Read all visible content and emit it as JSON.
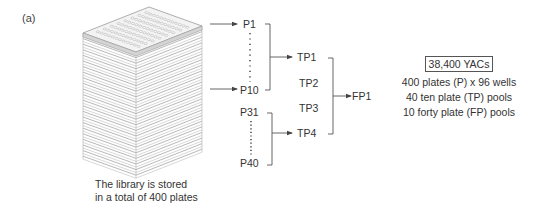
{
  "panel_label": "(a)",
  "stack": {
    "caption_line1": "The library is stored",
    "caption_line2": "in a total of 400 plates",
    "plate_count_drawn": 22
  },
  "plates": {
    "group1": {
      "first": "P1",
      "last": "P10"
    },
    "group2": {
      "first": "P31",
      "last": "P40"
    }
  },
  "ten_plate_pools": [
    "TP1",
    "TP2",
    "TP3",
    "TP4"
  ],
  "forty_plate_pool": "FP1",
  "summary": {
    "total": "38,400 YACs",
    "lines": [
      "400 plates (P) x 96 wells",
      "40 ten plate (TP) pools",
      "10 forty plate (FP) pools"
    ]
  },
  "colors": {
    "line": "#555555",
    "plate_edge": "#9a9a9a",
    "top_plate_fill": "#d4d4d4"
  }
}
